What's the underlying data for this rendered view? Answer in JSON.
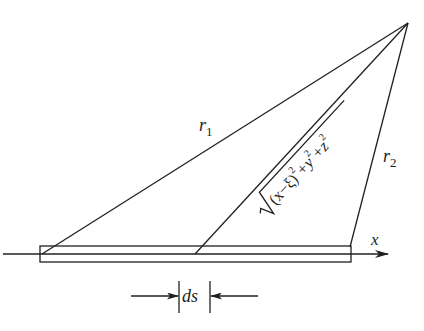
{
  "diagram": {
    "type": "geometry-figure",
    "labels": {
      "r1": {
        "main": "r",
        "sub": "1"
      },
      "r2": {
        "main": "r",
        "sub": "2"
      },
      "x_axis": "x",
      "element": "ds",
      "formula": {
        "radical": "√",
        "body": "(x−ξ)",
        "exp1": "2",
        "plus1": "+y",
        "exp2": "2",
        "plus2": "+z",
        "exp3": "2"
      }
    },
    "colors": {
      "stroke": "#231f20",
      "background": "#ffffff"
    }
  }
}
